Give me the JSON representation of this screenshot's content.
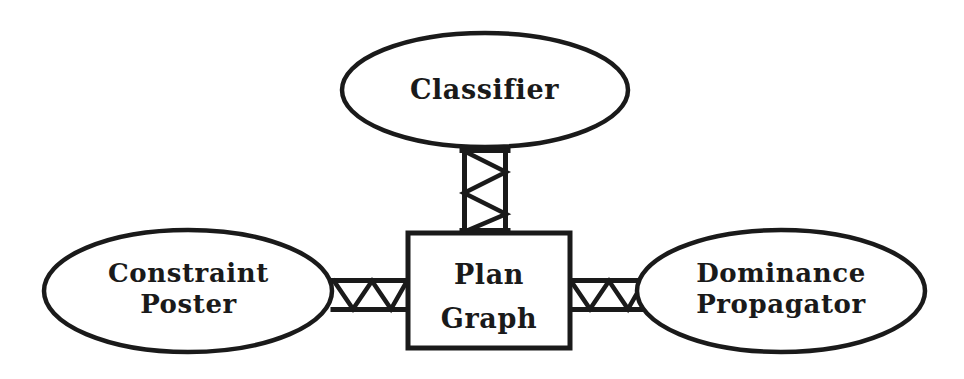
{
  "diagram": {
    "background_color": "#ffffff",
    "stroke_color": "#1a1a1a",
    "nodes": [
      {
        "id": "classifier",
        "shape": "ellipse",
        "label": "Classifier",
        "label_lines": [
          "Classifier"
        ],
        "cx": 485,
        "cy": 90,
        "rx": 143,
        "ry": 57
      },
      {
        "id": "constraint-poster",
        "shape": "ellipse",
        "label": "Constraint Poster",
        "label_lines": [
          "Constraint",
          "Poster"
        ],
        "cx": 188,
        "cy": 291,
        "rx": 144,
        "ry": 61
      },
      {
        "id": "plan-graph",
        "shape": "rectangle",
        "label": "Plan Graph",
        "label_lines": [
          "Plan",
          "Graph"
        ],
        "x": 408,
        "y": 233,
        "width": 162,
        "height": 115
      },
      {
        "id": "dominance-propagator",
        "shape": "ellipse",
        "label": "Dominance Propagator",
        "label_lines": [
          "Dominance",
          "Propagator"
        ],
        "cx": 781,
        "cy": 291,
        "rx": 144,
        "ry": 61
      }
    ],
    "connectors": [
      {
        "id": "classifier-plan-graph",
        "style": "truss-zigzag",
        "orientation": "vertical",
        "from": "classifier",
        "to": "plan-graph",
        "x1": 462,
        "x2": 508,
        "y1": 148,
        "y2": 233,
        "segments": 4
      },
      {
        "id": "constraint-poster-plan-graph",
        "style": "truss-zigzag",
        "orientation": "horizontal",
        "from": "constraint-poster",
        "to": "plan-graph",
        "x1": 333,
        "x2": 408,
        "y1": 278,
        "y2": 312,
        "segments": 4
      },
      {
        "id": "plan-graph-dominance-propagator",
        "style": "truss-zigzag",
        "orientation": "horizontal",
        "from": "plan-graph",
        "to": "dominance-propagator",
        "x1": 570,
        "x2": 645,
        "y1": 278,
        "y2": 312,
        "segments": 4
      }
    ]
  }
}
